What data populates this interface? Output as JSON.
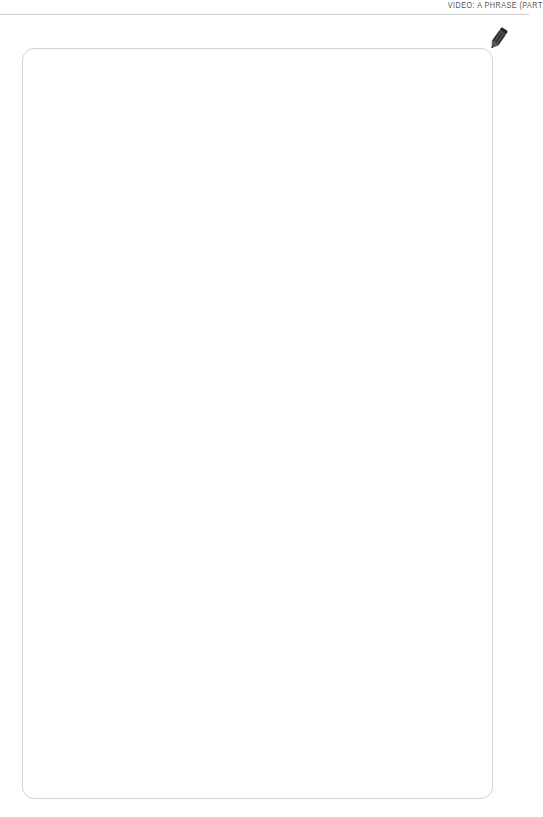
{
  "header": {
    "title": "VIDEO: A PHRASE (PART"
  },
  "notes_box": {
    "icon": "pencil-icon",
    "border_color": "#d4d4d4",
    "content": ""
  }
}
